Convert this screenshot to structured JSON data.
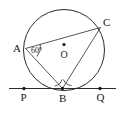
{
  "figure": {
    "type": "circle-geometry-diagram",
    "background_color": "#ffffff",
    "stroke_color": "#2b2b2b",
    "text_color": "#1a1a1a",
    "labels": {
      "point_a": "A",
      "point_b": "B",
      "point_c": "C",
      "point_o": "O",
      "point_p": "P",
      "point_q": "Q",
      "angle_a": "60°"
    },
    "circle": {
      "center_x": 64,
      "center_y": 50,
      "radius": 40.5
    },
    "points": {
      "A": {
        "x": 25.5,
        "y": 48.5
      },
      "B": {
        "x": 62.5,
        "y": 88.5
      },
      "C": {
        "x": 100.5,
        "y": 27.5
      },
      "O": {
        "x": 64,
        "y": 50
      },
      "P": {
        "x": 24,
        "y": 88.5
      },
      "Q": {
        "x": 100,
        "y": 88.5
      }
    },
    "tangent_line": {
      "x_start": 9,
      "x_end": 116,
      "y": 88.5
    },
    "chords": [
      {
        "name": "AC",
        "from": "A",
        "to": "C"
      },
      {
        "name": "AB",
        "from": "A",
        "to": "B"
      },
      {
        "name": "CB",
        "from": "C",
        "to": "B"
      }
    ],
    "angle_marks": [
      {
        "name": "angle-at-a",
        "vertex": "A",
        "value": "60°"
      },
      {
        "name": "angle-pba",
        "vertex": "B"
      },
      {
        "name": "angle-cbq",
        "vertex": "B"
      }
    ]
  }
}
